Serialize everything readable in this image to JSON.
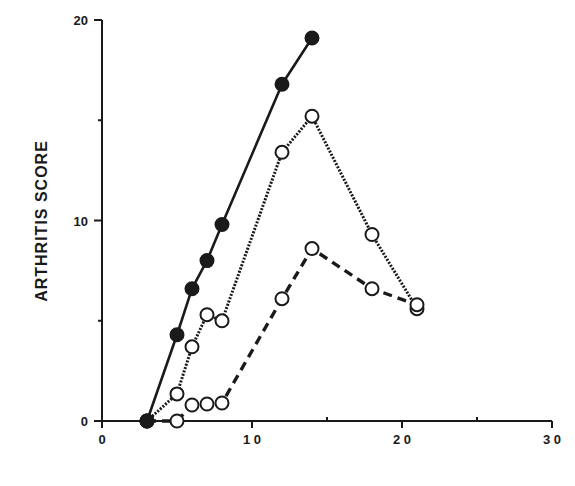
{
  "chart_data": {
    "type": "line",
    "title": "",
    "xlabel": "",
    "ylabel": "ARTHRITIS  SCORE",
    "xlim": [
      0,
      30
    ],
    "ylim": [
      0,
      20
    ],
    "x_ticks": [
      0,
      10,
      20,
      30
    ],
    "x_tick_labels": [
      "0",
      "1 0",
      "2 0",
      "3 0"
    ],
    "x_minor_ticks": [
      5,
      15,
      25
    ],
    "y_ticks": [
      0,
      10,
      20
    ],
    "y_tick_labels": [
      "0",
      "10",
      "20"
    ],
    "y_minor_ticks": [
      5,
      15
    ],
    "grid": false,
    "legend": null,
    "series": [
      {
        "name": "solid-filled",
        "line_style": "solid",
        "marker": "filled-circle",
        "x": [
          3,
          5,
          6,
          7,
          8,
          12,
          14
        ],
        "y": [
          0,
          4.3,
          6.6,
          8.0,
          9.8,
          16.8,
          19.1
        ]
      },
      {
        "name": "dotted-open",
        "line_style": "dotted",
        "marker": "open-circle",
        "x": [
          3,
          5,
          6,
          7,
          8,
          12,
          14,
          18,
          21
        ],
        "y": [
          0,
          1.35,
          3.7,
          5.3,
          5.0,
          13.4,
          15.2,
          9.3,
          5.6
        ]
      },
      {
        "name": "dashed-open",
        "line_style": "dashed",
        "marker": "open-circle",
        "x": [
          3,
          5,
          6,
          7,
          8,
          12,
          14,
          18,
          21
        ],
        "y": [
          0,
          0,
          0.8,
          0.85,
          0.9,
          6.1,
          8.6,
          6.6,
          5.8
        ]
      }
    ]
  },
  "colors": {
    "ink": "#1a1a1a",
    "background": "#ffffff"
  }
}
